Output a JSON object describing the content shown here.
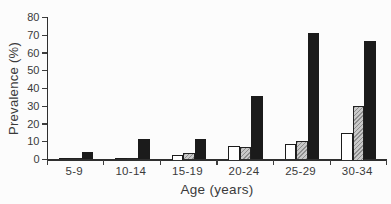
{
  "figure": {
    "background": "#fcfcfc"
  },
  "chart_data": {
    "type": "bar",
    "title": "",
    "xlabel": "Age (years)",
    "ylabel": "Prevalence (%)",
    "ylim": [
      0,
      80
    ],
    "yticks": [
      0,
      10,
      20,
      30,
      40,
      50,
      60,
      70,
      80
    ],
    "grid": false,
    "legend": "none",
    "categories": [
      "5-9",
      "10-14",
      "15-19",
      "20-24",
      "25-29",
      "30-34"
    ],
    "series": [
      {
        "name": "white-bars",
        "fill": "white",
        "color": "#ffffff",
        "border_color": "#1c1c1c",
        "values": [
          0.5,
          0.5,
          2.5,
          7.5,
          9,
          15
        ]
      },
      {
        "name": "gray-hatched-bars",
        "fill": "hatched",
        "color": "#c4c4c4",
        "border_color": "#222222",
        "values": [
          1,
          1,
          3.5,
          7,
          10.5,
          30
        ]
      },
      {
        "name": "black-bars",
        "fill": "solid",
        "color": "#1b1b1b",
        "border_color": "#1b1b1b",
        "values": [
          4,
          11.5,
          11.5,
          36,
          71,
          67
        ]
      }
    ]
  }
}
